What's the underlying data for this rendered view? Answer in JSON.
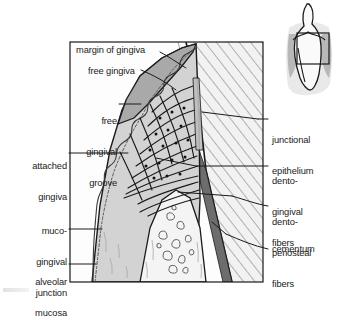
{
  "figure": {
    "frame": {
      "x": 70,
      "y": 42,
      "w": 193,
      "h": 240
    }
  },
  "colors": {
    "free_gingiva": "#a9a9a9",
    "attached_gingiva": "#c9c9c9",
    "alveolar_mucosa": "#d5d5d5",
    "bone": "#efefef",
    "tooth_hatch": "#b9b9b9",
    "cementum": "#6d6d6d",
    "outline": "#1a1a1a",
    "inset_light": "#e8e8e8",
    "inset_mid": "#b6b6b6",
    "leader": "#1a1a1a"
  },
  "labels": {
    "margin_of_gingiva": {
      "text": "margin of gingiva",
      "align": "left",
      "x": 76,
      "y": 45
    },
    "free_gingiva": {
      "text": "free gingiva",
      "align": "left",
      "x": 88,
      "y": 66
    },
    "free_gingival_groove": {
      "line1": "free",
      "line2": "gingival",
      "line3": "groove",
      "align": "right",
      "x": 62,
      "y": 95,
      "w": 55
    },
    "attached_gingiva": {
      "line1": "attached",
      "line2": "gingiva",
      "align": "right",
      "x": 3,
      "y": 140,
      "w": 64
    },
    "muco_gingival_junction": {
      "line1": "muco-",
      "line2": "gingival",
      "line3": "junction",
      "align": "right",
      "x": 3,
      "y": 205,
      "w": 64
    },
    "alveolar_mucosa": {
      "line1": "alveolar",
      "line2": "mucosa",
      "align": "right",
      "x": 3,
      "y": 255,
      "w": 64
    },
    "junctional_epithelium": {
      "line1": "junctional",
      "line2": "epithelium",
      "align": "left",
      "x": 272,
      "y": 114
    },
    "dento_gingival_fibers": {
      "line1": "dento-",
      "line2": "gingival",
      "line3": "fibers",
      "align": "left",
      "x": 272,
      "y": 155
    },
    "dento_periosteal_fibers": {
      "line1": "dento-",
      "line2": "periosteal",
      "line3": "fibers",
      "align": "left",
      "x": 272,
      "y": 200
    },
    "cementum": {
      "text": "cementum",
      "align": "left",
      "x": 272,
      "y": 245
    }
  },
  "inset": {
    "name": "orientation-inset-tooth",
    "box": {
      "x": 297,
      "y": 33,
      "w": 32,
      "h": 31
    }
  }
}
